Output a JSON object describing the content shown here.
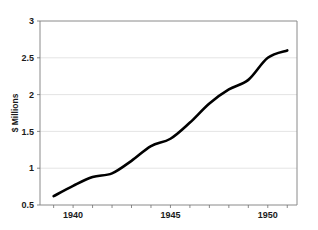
{
  "chart_data": {
    "type": "line",
    "title": "",
    "subtitle": "",
    "xlabel": "",
    "ylabel": "$ Millions",
    "xlim": [
      1938.3,
      1951.5
    ],
    "ylim": [
      0.5,
      3
    ],
    "grid": true,
    "legend": false,
    "legend_position": "none",
    "x_tick_labels": [
      "1940",
      "1945",
      "1950"
    ],
    "x_tick_values": [
      1940,
      1945,
      1950
    ],
    "x_minor_tick_values": [
      1939,
      1941,
      1942,
      1943,
      1944,
      1946,
      1947,
      1948,
      1949,
      1951
    ],
    "y_tick_labels": [
      "0.5",
      "1",
      "1.5",
      "2",
      "2.5",
      "3"
    ],
    "y_tick_values": [
      0.5,
      1,
      1.5,
      2,
      2.5,
      3
    ],
    "series": [
      {
        "name": "$ Millions",
        "color": "#000000",
        "x": [
          1939,
          1940,
          1941,
          1942,
          1943,
          1944,
          1945,
          1946,
          1947,
          1948,
          1949,
          1950,
          1951
        ],
        "values": [
          0.62,
          0.76,
          0.88,
          0.93,
          1.1,
          1.3,
          1.4,
          1.62,
          1.88,
          2.07,
          2.2,
          2.5,
          2.6
        ]
      }
    ]
  },
  "axes": {
    "y_axis_title": "$ Millions"
  }
}
